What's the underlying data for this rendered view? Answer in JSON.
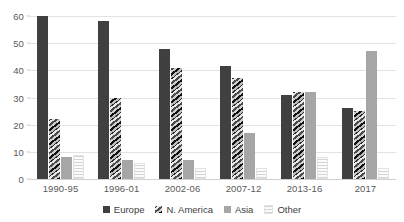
{
  "chart_data": {
    "type": "bar",
    "title": "",
    "subtitle": "",
    "xlabel": "",
    "ylabel": "",
    "ylim": [
      0,
      60
    ],
    "ytick_labels": [
      "60",
      "50",
      "40",
      "30",
      "20",
      "10",
      "0"
    ],
    "ytick_values": [
      60,
      50,
      40,
      30,
      20,
      10,
      0
    ],
    "grid": true,
    "legend_position": "bottom",
    "categories": [
      "1990-95",
      "1996-01",
      "2002-06",
      "2007-12",
      "2013-16",
      "2017"
    ],
    "series": [
      {
        "name": "Europe",
        "color": "#404040",
        "fill": "solid",
        "values": [
          60,
          58,
          48,
          41.5,
          31,
          26
        ]
      },
      {
        "name": "N. America",
        "color": "#737373",
        "fill": "hatched",
        "values": [
          22,
          30,
          41,
          37,
          32,
          25
        ]
      },
      {
        "name": "Asia",
        "color": "#a6a6a6",
        "fill": "solid",
        "values": [
          8,
          7,
          7,
          17,
          32,
          47
        ]
      },
      {
        "name": "Other",
        "color": "#f0f0f0",
        "fill": "dotted",
        "values": [
          9,
          6,
          4,
          4,
          8,
          4
        ]
      }
    ]
  }
}
